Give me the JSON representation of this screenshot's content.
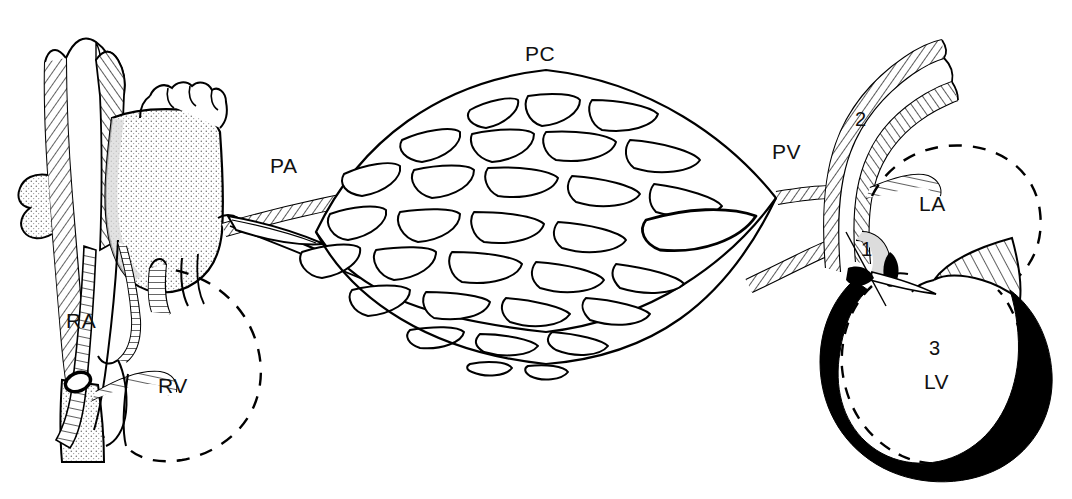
{
  "figure": {
    "background_color": "#ffffff",
    "ink_color": "#000000",
    "width": 1072,
    "height": 499
  },
  "labels": {
    "right_atrium": "RA",
    "right_ventricle": "RV",
    "pulmonary_artery": "PA",
    "pulmonary_capillaries": "PC",
    "pulmonary_veins": "PV",
    "left_atrium": "LA",
    "left_ventricle": "LV",
    "marker_one": "1",
    "marker_two": "2",
    "marker_three": "3"
  },
  "label_positions": {
    "right_atrium": {
      "x": 66,
      "y": 328
    },
    "right_ventricle": {
      "x": 158,
      "y": 393
    },
    "pulmonary_artery": {
      "x": 270,
      "y": 173
    },
    "pulmonary_capillaries": {
      "x": 525,
      "y": 61
    },
    "pulmonary_veins": {
      "x": 772,
      "y": 159
    },
    "left_atrium": {
      "x": 919,
      "y": 211
    },
    "left_ventricle": {
      "x": 924,
      "y": 389
    },
    "marker_one": {
      "x": 861,
      "y": 256
    },
    "marker_two": {
      "x": 855,
      "y": 126
    },
    "marker_three": {
      "x": 929,
      "y": 355
    }
  },
  "structures": [
    {
      "name": "superior-vena-cava",
      "style": "hatched-wall"
    },
    {
      "name": "inferior-vena-cava",
      "style": "stippled"
    },
    {
      "name": "aorta",
      "style": "stippled"
    },
    {
      "name": "right-atrium-chamber",
      "style": "outline-hatched-wall"
    },
    {
      "name": "right-ventricle-chamber",
      "style": "dashed-outline"
    },
    {
      "name": "pulmonary-artery-trunk",
      "style": "hatched-wall"
    },
    {
      "name": "pulmonary-capillary-bed",
      "style": "mesh-network"
    },
    {
      "name": "pulmonary-veins-trunk",
      "style": "hatched-wall"
    },
    {
      "name": "left-atrium-chamber",
      "style": "dashed-outline"
    },
    {
      "name": "mitral-valve-leaflets",
      "style": "line-hatched"
    },
    {
      "name": "left-ventricle-chamber",
      "style": "dashed-outline"
    },
    {
      "name": "left-ventricle-myocardium",
      "style": "solid-black"
    },
    {
      "name": "pointer-line-marker-one",
      "style": "thin-leader-line"
    }
  ],
  "capillary_mesh": {
    "cell_count_approx": 45,
    "shape": "lens",
    "center": {
      "x": 545,
      "y": 195
    },
    "half_width": 230,
    "half_height": 130
  }
}
